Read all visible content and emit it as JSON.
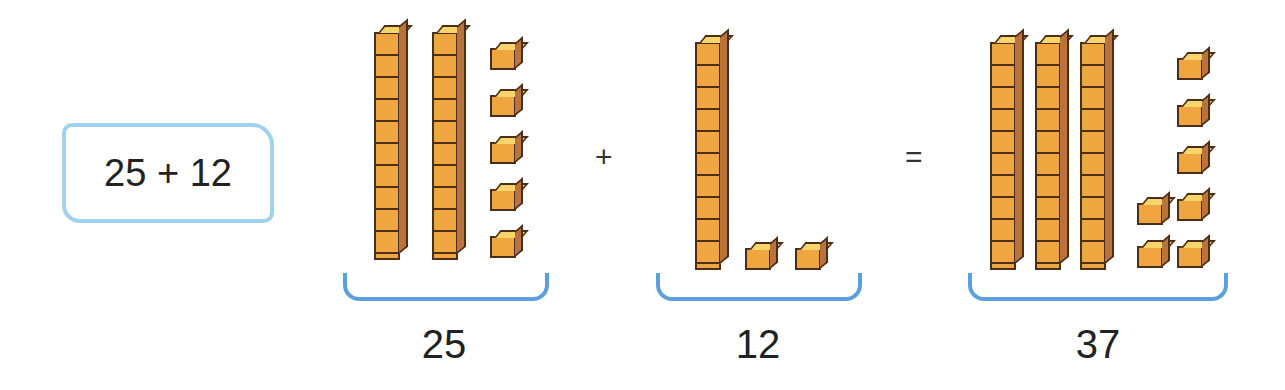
{
  "expression": {
    "text": "25 + 12"
  },
  "operators": {
    "plus": "+",
    "equals": "="
  },
  "groups": [
    {
      "label": "25",
      "tens": 2,
      "ones": 5
    },
    {
      "label": "12",
      "tens": 1,
      "ones": 2
    },
    {
      "label": "37",
      "tens": 3,
      "ones": 7
    }
  ],
  "colors": {
    "cube": "#f0a640",
    "bracket": "#5b9fdc",
    "box_border": "#9fd2ef"
  }
}
